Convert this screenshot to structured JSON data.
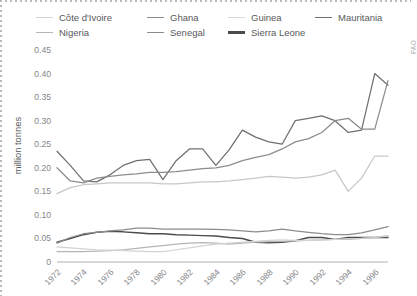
{
  "chart_data": {
    "type": "line",
    "title": "",
    "xlabel": "",
    "ylabel": "million tonnes",
    "xlim": [
      1972,
      1997
    ],
    "ylim": [
      0,
      0.45
    ],
    "ytick_labels": [
      "0",
      "0.05",
      "0.10",
      "0.15",
      "0.20",
      "0.25",
      "0.30",
      "0.35",
      "0.40",
      "0.45"
    ],
    "ytick_values": [
      0,
      0.05,
      0.1,
      0.15,
      0.2,
      0.25,
      0.3,
      0.35,
      0.4,
      0.45
    ],
    "xtick_labels": [
      "1972",
      "1974",
      "1976",
      "1978",
      "1980",
      "1982",
      "1984",
      "1986",
      "1988",
      "1990",
      "1992",
      "1994",
      "1996"
    ],
    "xtick_values": [
      1972,
      1974,
      1976,
      1978,
      1980,
      1982,
      1984,
      1986,
      1988,
      1990,
      1992,
      1994,
      1996
    ],
    "x": [
      1972,
      1973,
      1974,
      1975,
      1976,
      1977,
      1978,
      1979,
      1980,
      1981,
      1982,
      1983,
      1984,
      1985,
      1986,
      1987,
      1988,
      1989,
      1990,
      1991,
      1992,
      1993,
      1994,
      1995,
      1996,
      1997
    ],
    "grid": false,
    "legend_position": "top",
    "source_note": "FAO",
    "series": [
      {
        "name": "Mauritania",
        "color": "#6f7073",
        "width": 1.25,
        "values": [
          0.235,
          0.205,
          0.172,
          0.17,
          0.185,
          0.205,
          0.215,
          0.218,
          0.175,
          0.215,
          0.24,
          0.24,
          0.205,
          0.238,
          0.28,
          0.265,
          0.255,
          0.25,
          0.3,
          0.305,
          0.31,
          0.3,
          0.275,
          0.28,
          0.4,
          0.375
        ]
      },
      {
        "name": "Ghana",
        "color": "#8b8c8f",
        "width": 1.25,
        "values": [
          0.2,
          0.172,
          0.168,
          0.178,
          0.182,
          0.185,
          0.187,
          0.19,
          0.19,
          0.192,
          0.195,
          0.198,
          0.2,
          0.205,
          0.215,
          0.222,
          0.228,
          0.24,
          0.255,
          0.262,
          0.275,
          0.3,
          0.305,
          0.282,
          0.282,
          0.385
        ]
      },
      {
        "name": "Guinea",
        "color": "#c6c7c9",
        "width": 1.25,
        "values": [
          0.145,
          0.158,
          0.164,
          0.166,
          0.168,
          0.168,
          0.168,
          0.168,
          0.166,
          0.166,
          0.168,
          0.17,
          0.17,
          0.172,
          0.175,
          0.178,
          0.182,
          0.18,
          0.178,
          0.18,
          0.185,
          0.195,
          0.15,
          0.178,
          0.225,
          0.225
        ]
      },
      {
        "name": "Sierra Leone",
        "color": "#4a4b4d",
        "width": 1.45,
        "values": [
          0.042,
          0.05,
          0.058,
          0.063,
          0.065,
          0.064,
          0.062,
          0.06,
          0.06,
          0.058,
          0.057,
          0.056,
          0.055,
          0.052,
          0.05,
          0.042,
          0.041,
          0.042,
          0.045,
          0.052,
          0.052,
          0.048,
          0.052,
          0.052,
          0.052,
          0.052
        ]
      },
      {
        "name": "Senegal",
        "color": "#8b8c8f",
        "width": 1.25,
        "values": [
          0.04,
          0.052,
          0.06,
          0.063,
          0.066,
          0.068,
          0.072,
          0.072,
          0.07,
          0.07,
          0.07,
          0.07,
          0.069,
          0.068,
          0.066,
          0.064,
          0.066,
          0.07,
          0.066,
          0.063,
          0.06,
          0.058,
          0.058,
          0.062,
          0.068,
          0.075
        ]
      },
      {
        "name": "Nigeria",
        "color": "#b4b5b8",
        "width": 1.25,
        "values": [
          0.022,
          0.022,
          0.022,
          0.023,
          0.024,
          0.026,
          0.029,
          0.032,
          0.035,
          0.038,
          0.04,
          0.041,
          0.04,
          0.038,
          0.04,
          0.042,
          0.043,
          0.044,
          0.045,
          0.046,
          0.047,
          0.048,
          0.048,
          0.05,
          0.052,
          0.056
        ]
      },
      {
        "name": "Côte d'Ivoire",
        "color": "#d2d3d5",
        "width": 1.25,
        "values": [
          0.032,
          0.03,
          0.028,
          0.026,
          0.025,
          0.024,
          0.023,
          0.022,
          0.022,
          0.026,
          0.03,
          0.034,
          0.038,
          0.04,
          0.042,
          0.044,
          0.046,
          0.047,
          0.046,
          0.046,
          0.047,
          0.048,
          0.049,
          0.05,
          0.052,
          0.055
        ]
      }
    ]
  },
  "legend": {
    "rows": [
      [
        {
          "label": "Côte d'Ivoire",
          "color": "#d2d3d5",
          "width": 1.6
        },
        {
          "label": "Ghana",
          "color": "#8b8c8f",
          "width": 1.8
        },
        {
          "label": "Guinea",
          "color": "#d8d9db",
          "width": 1.6
        },
        {
          "label": "Mauritania",
          "color": "#6f7073",
          "width": 1.8
        }
      ],
      [
        {
          "label": "Nigeria",
          "color": "#b4b5b8",
          "width": 1.6
        },
        {
          "label": "Senegal",
          "color": "#8b8c8f",
          "width": 1.8
        },
        {
          "label": "Sierra Leone",
          "color": "#4a4b4d",
          "width": 2.2
        }
      ]
    ],
    "item_offsets_row1": [
      0,
      111,
      192,
      279
    ],
    "item_offsets_row2": [
      0,
      111,
      192
    ]
  },
  "axis": {
    "ylabel": "million tonnes",
    "source": "FAO"
  }
}
